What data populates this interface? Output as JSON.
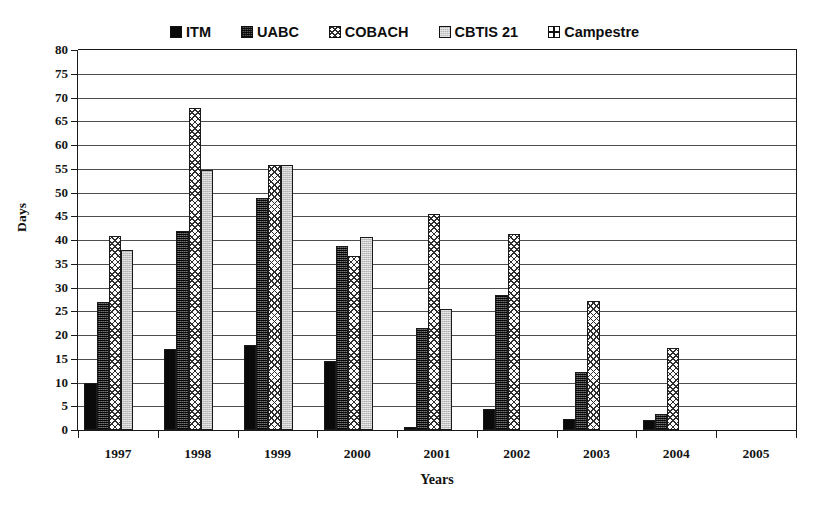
{
  "chart_data": {
    "type": "bar",
    "title": "",
    "xlabel": "Years",
    "ylabel": "Days",
    "ylim": [
      0,
      80
    ],
    "ytick_step": 5,
    "yticks": [
      80,
      75,
      70,
      65,
      60,
      55,
      50,
      45,
      40,
      35,
      30,
      25,
      20,
      15,
      10,
      5,
      0
    ],
    "categories": [
      "1997",
      "1998",
      "1999",
      "2000",
      "2001",
      "2002",
      "2003",
      "2004",
      "2005"
    ],
    "grid": true,
    "legend_position": "top",
    "series": [
      {
        "name": "ITM",
        "pattern": "solid-black",
        "values": [
          10,
          17,
          17.8,
          14.6,
          0.7,
          4.4,
          2.4,
          2.2,
          null
        ]
      },
      {
        "name": "UABC",
        "pattern": "dark-dotted",
        "values": [
          27,
          41.8,
          48.8,
          38.8,
          21.5,
          28.4,
          12.3,
          3.3,
          null
        ]
      },
      {
        "name": "COBACH",
        "pattern": "diamond-cross",
        "values": [
          40.9,
          67.7,
          55.7,
          36.6,
          45.4,
          41.3,
          27.1,
          17.2,
          null
        ]
      },
      {
        "name": "CBTIS 21",
        "pattern": "light-gray",
        "values": [
          38,
          54.8,
          55.7,
          40.6,
          25.4,
          null,
          null,
          null,
          null
        ]
      },
      {
        "name": "Campestre",
        "pattern": "grid-white",
        "values": [
          null,
          null,
          null,
          null,
          null,
          null,
          null,
          null,
          null
        ]
      }
    ]
  },
  "legend": {
    "items": [
      {
        "label": "ITM",
        "swatch": "legend-swatch-itm"
      },
      {
        "label": "UABC",
        "swatch": "legend-swatch-uabc"
      },
      {
        "label": "COBACH",
        "swatch": "legend-swatch-cobach"
      },
      {
        "label": "CBTIS 21",
        "swatch": "legend-swatch-cbtis-21"
      },
      {
        "label": "Campestre",
        "swatch": "legend-swatch-campestre"
      }
    ]
  },
  "colors": {
    "itm": "#0a0a0a",
    "uabc": "#5a5a5a",
    "cobach": "#fdfdfd",
    "cbtis21": "#bcbcbc",
    "campestre": "#ffffff",
    "axis": "#1a1a1a",
    "grid": "#2f2f2f",
    "background": "#ffffff"
  }
}
